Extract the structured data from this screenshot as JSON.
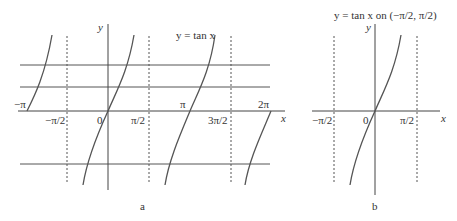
{
  "panel_a": {
    "caption": "a",
    "curve_label": "y = tan x",
    "y_axis_label": "y",
    "x_axis_label": "x",
    "tick_labels": [
      "−π",
      "−π/2",
      "0",
      "π/2",
      "π",
      "3π/2",
      "2π"
    ]
  },
  "panel_b": {
    "caption": "b",
    "title": "y = tan x on (−π/2, π/2)",
    "y_axis_label": "y",
    "x_axis_label": "x",
    "tick_labels": [
      "−π/2",
      "0",
      "π/2"
    ]
  },
  "colors": {
    "curve": "#555555",
    "axis": "#444444",
    "asymptote": "#555555"
  }
}
